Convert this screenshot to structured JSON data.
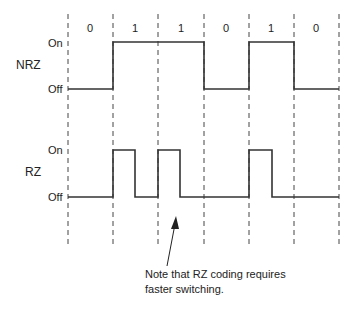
{
  "bits": [
    "0",
    "1",
    "1",
    "0",
    "1",
    "0"
  ],
  "nrz": {
    "label": "NRZ",
    "on_label": "On",
    "off_label": "Off"
  },
  "rz": {
    "label": "RZ",
    "on_label": "On",
    "off_label": "Off"
  },
  "note": {
    "line1": "Note that RZ coding requires",
    "line2": "faster switching."
  },
  "colors": {
    "line": "#333333",
    "dash": "#444444",
    "background": "#ffffff"
  }
}
